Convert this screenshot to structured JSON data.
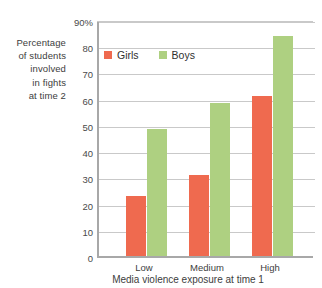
{
  "chart_data": {
    "type": "bar",
    "title": "",
    "categories": [
      "Low",
      "Medium",
      "High"
    ],
    "series": [
      {
        "name": "Girls",
        "color": "#ef6a4f",
        "values": [
          23,
          31,
          61
        ]
      },
      {
        "name": "Boys",
        "color": "#aed081",
        "values": [
          48.5,
          58.5,
          84
        ]
      }
    ],
    "xlabel": "Media violence exposure at time 1",
    "ylabel": "Percentage of students involved in fights at time 2",
    "ylabel_lines": [
      "Percentage",
      "of students",
      "involved",
      "in fights",
      "at time 2"
    ],
    "ylim": [
      0,
      90
    ],
    "ytick_values": [
      0,
      10,
      20,
      30,
      40,
      50,
      60,
      70,
      80,
      90
    ],
    "ytick_labels": [
      "0",
      "10",
      "20",
      "30",
      "40",
      "50",
      "60",
      "70",
      "80",
      "90%"
    ],
    "grid": true,
    "legend_position": "top-left-inside",
    "legend": [
      "Girls",
      "Boys"
    ]
  },
  "axis_color": "#a8a8a8",
  "grid_color": "#c9c9c9",
  "text_color": "#3d3d3d"
}
